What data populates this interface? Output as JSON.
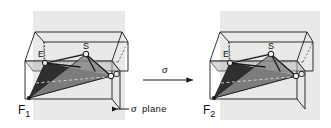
{
  "figure": {
    "background_color": "#ffffff",
    "panel_color": "#e9e9e7",
    "line_color": "#1a1a1a",
    "dark_fill": "#2a2a2a",
    "mid_fill": "#8d8d8d",
    "light_fill": "#b9b9b9"
  },
  "left_structure": {
    "name": "F1",
    "label": "F",
    "label_sub": "1",
    "atoms": [
      {
        "id": "E",
        "label": "E"
      },
      {
        "id": "S",
        "label": "S"
      },
      {
        "id": "O",
        "label": "O"
      }
    ]
  },
  "right_structure": {
    "name": "F2",
    "label": "F",
    "label_sub": "2",
    "atoms": [
      {
        "id": "E",
        "label": "E"
      },
      {
        "id": "S",
        "label": "S"
      },
      {
        "id": "O",
        "label": "O"
      }
    ]
  },
  "operation": {
    "symbol": "σ",
    "direction": "right"
  },
  "annotation": {
    "symbol": "σ",
    "text": "plane",
    "arrow_direction": "left"
  }
}
